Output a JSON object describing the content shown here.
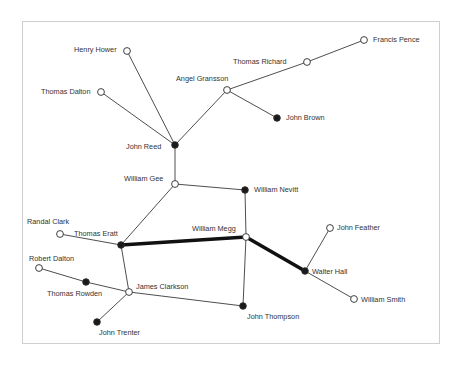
{
  "diagram": {
    "type": "social-network",
    "nodes": [
      {
        "id": "henry_hower",
        "label": "Henry Hower",
        "x": 127,
        "y": 51,
        "filled": false,
        "lx": 74,
        "ly": 46
      },
      {
        "id": "thomas_dalton",
        "label": "Thomas Dalton",
        "x": 101,
        "y": 92,
        "filled": false,
        "lx": 41,
        "ly": 88
      },
      {
        "id": "angel_gransson",
        "label": "Angel Gransson",
        "x": 227,
        "y": 90,
        "filled": false,
        "lx": 176,
        "ly": 75
      },
      {
        "id": "thomas_richard",
        "label": "Thomas Richard",
        "x": 307,
        "y": 62,
        "filled": false,
        "lx": 233,
        "ly": 58
      },
      {
        "id": "francis_pence",
        "label": "Francis Pence",
        "x": 364,
        "y": 40,
        "filled": false,
        "lx": 373,
        "ly": 36
      },
      {
        "id": "john_brown",
        "label": "John Brown",
        "x": 277,
        "y": 118,
        "filled": true,
        "lx": 286,
        "ly": 114
      },
      {
        "id": "john_reed",
        "label": "John Reed",
        "x": 175,
        "y": 145,
        "filled": true,
        "lx": 126,
        "ly": 143
      },
      {
        "id": "william_gee",
        "label": "William Gee",
        "x": 175,
        "y": 184,
        "filled": false,
        "lx": 124,
        "ly": 175
      },
      {
        "id": "william_nevitt",
        "label": "William Nevitt",
        "x": 245,
        "y": 190,
        "filled": true,
        "lx": 254,
        "ly": 186
      },
      {
        "id": "randal_clark",
        "label": "Randal Clark",
        "x": 60,
        "y": 234,
        "filled": false,
        "lx": 27,
        "ly": 218
      },
      {
        "id": "thomas_eratt",
        "label": "Thomas Eratt",
        "x": 121,
        "y": 245,
        "filled": true,
        "lx": 74,
        "ly": 230
      },
      {
        "id": "william_megg",
        "label": "William Megg",
        "x": 246,
        "y": 237,
        "filled": false,
        "lx": 192,
        "ly": 225
      },
      {
        "id": "john_feather",
        "label": "John Feather",
        "x": 330,
        "y": 228,
        "filled": false,
        "lx": 337,
        "ly": 224
      },
      {
        "id": "walter_hall",
        "label": "Walter Hall",
        "x": 305,
        "y": 271,
        "filled": true,
        "lx": 312,
        "ly": 268
      },
      {
        "id": "william_smith",
        "label": "William Smith",
        "x": 354,
        "y": 299,
        "filled": false,
        "lx": 361,
        "ly": 296
      },
      {
        "id": "robert_dalton",
        "label": "Robert Dalton",
        "x": 39,
        "y": 268,
        "filled": false,
        "lx": 29,
        "ly": 255
      },
      {
        "id": "thomas_rowden",
        "label": "Thomas Rowden",
        "x": 86,
        "y": 282,
        "filled": true,
        "lx": 47,
        "ly": 290
      },
      {
        "id": "james_clarkson",
        "label": "James Clarkson",
        "x": 129,
        "y": 292,
        "filled": false,
        "lx": 136,
        "ly": 283
      },
      {
        "id": "john_trenter",
        "label": "John Trenter",
        "x": 97,
        "y": 322,
        "filled": true,
        "lx": 99,
        "ly": 329
      },
      {
        "id": "john_thompson",
        "label": "John Thompson",
        "x": 243,
        "y": 306,
        "filled": true,
        "lx": 247,
        "ly": 313
      }
    ],
    "edges": [
      {
        "from": "henry_hower",
        "to": "john_reed",
        "weight": 1
      },
      {
        "from": "thomas_dalton",
        "to": "john_reed",
        "weight": 1
      },
      {
        "from": "angel_gransson",
        "to": "john_reed",
        "weight": 1
      },
      {
        "from": "angel_gransson",
        "to": "thomas_richard",
        "weight": 1
      },
      {
        "from": "thomas_richard",
        "to": "francis_pence",
        "weight": 1
      },
      {
        "from": "angel_gransson",
        "to": "john_brown",
        "weight": 1
      },
      {
        "from": "john_reed",
        "to": "william_gee",
        "weight": 1
      },
      {
        "from": "william_gee",
        "to": "william_nevitt",
        "weight": 1
      },
      {
        "from": "william_gee",
        "to": "thomas_eratt",
        "weight": 1
      },
      {
        "from": "william_nevitt",
        "to": "william_megg",
        "weight": 1
      },
      {
        "from": "randal_clark",
        "to": "thomas_eratt",
        "weight": 1
      },
      {
        "from": "thomas_eratt",
        "to": "william_megg",
        "weight": 3
      },
      {
        "from": "william_megg",
        "to": "walter_hall",
        "weight": 3
      },
      {
        "from": "walter_hall",
        "to": "john_feather",
        "weight": 1
      },
      {
        "from": "walter_hall",
        "to": "william_smith",
        "weight": 1
      },
      {
        "from": "william_megg",
        "to": "john_thompson",
        "weight": 1
      },
      {
        "from": "thomas_eratt",
        "to": "james_clarkson",
        "weight": 1
      },
      {
        "from": "james_clarkson",
        "to": "john_thompson",
        "weight": 1
      },
      {
        "from": "robert_dalton",
        "to": "thomas_rowden",
        "weight": 1
      },
      {
        "from": "thomas_rowden",
        "to": "james_clarkson",
        "weight": 1
      },
      {
        "from": "james_clarkson",
        "to": "john_trenter",
        "weight": 1
      }
    ],
    "colors": {
      "edge": "#3a3a3a",
      "node_filled": "#1a1a1a",
      "node_open_fill": "#ffffff",
      "node_stroke": "#2a2a2a",
      "label": "#333333",
      "frame": "#cfcfcf"
    }
  }
}
